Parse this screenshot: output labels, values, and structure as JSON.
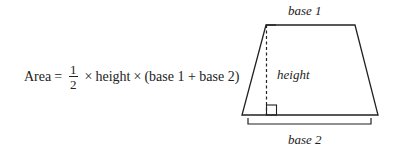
{
  "formula": {
    "lhs": "Area",
    "equals": "=",
    "fraction": {
      "numerator": "1",
      "denominator": "2"
    },
    "times1": "×",
    "height_term": "height",
    "times2": "×",
    "sum_term": "(base 1 + base 2)"
  },
  "diagram": {
    "shape": "trapezoid",
    "labels": {
      "top": "base 1",
      "height": "height",
      "bottom": "base 2"
    },
    "stroke_color": "#222222"
  }
}
